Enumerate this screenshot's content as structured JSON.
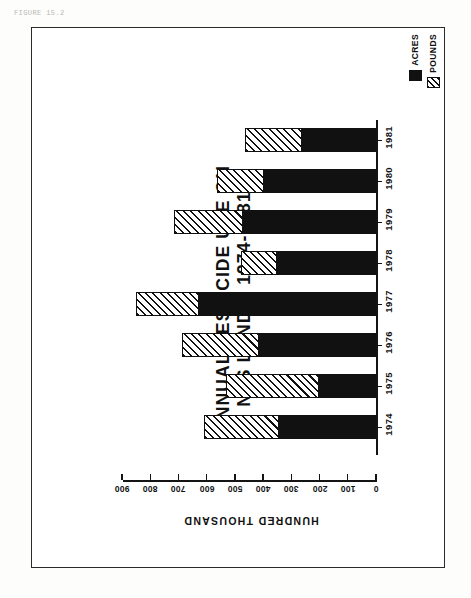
{
  "figure": {
    "caption": "FIGURE 15.2"
  },
  "legend": {
    "position": "top-right",
    "items": [
      {
        "label": "ACRES",
        "swatch": "solid-black-swatch",
        "color": "#111111"
      },
      {
        "label": "POUNDS",
        "swatch": "hatched-swatch",
        "color": "#111111"
      }
    ]
  },
  "title": {
    "line1": "ANNUAL  PESTICIDE  USE  ON",
    "line2": "NFS  LANDS,  1974-1981"
  },
  "axes": {
    "value_axis_title": "HUNDRED  THOUSAND",
    "value_ticks": [
      "900",
      "800",
      "700",
      "600",
      "500",
      "400",
      "300",
      "200",
      "100",
      "0"
    ],
    "category_ticks": [
      "1981",
      "1980",
      "1979",
      "1978",
      "1977",
      "1976",
      "1975",
      "1974"
    ]
  },
  "chart_data": {
    "type": "bar",
    "orientation": "horizontal-stacked",
    "title": "ANNUAL PESTICIDE USE ON NFS LANDS, 1974-1981",
    "xlabel": "HUNDRED THOUSAND",
    "ylabel": "",
    "xlim": [
      0,
      900
    ],
    "xticks": [
      0,
      100,
      200,
      300,
      400,
      500,
      600,
      700,
      800,
      900
    ],
    "grid": false,
    "legend_position": "top-right",
    "categories": [
      "1974",
      "1975",
      "1976",
      "1977",
      "1978",
      "1979",
      "1980",
      "1981"
    ],
    "series": [
      {
        "name": "ACRES",
        "values": [
          345,
          203,
          416,
          626,
          352,
          473,
          398,
          263
        ]
      },
      {
        "name": "POUNDS",
        "values": [
          263,
          327,
          271,
          224,
          125,
          242,
          167,
          202
        ]
      }
    ],
    "totals": [
      608,
      530,
      687,
      850,
      477,
      715,
      565,
      465
    ],
    "note": "POUNDS is the outer (hatched) stacked segment; ACRES is the inner solid black segment measured from 0."
  }
}
